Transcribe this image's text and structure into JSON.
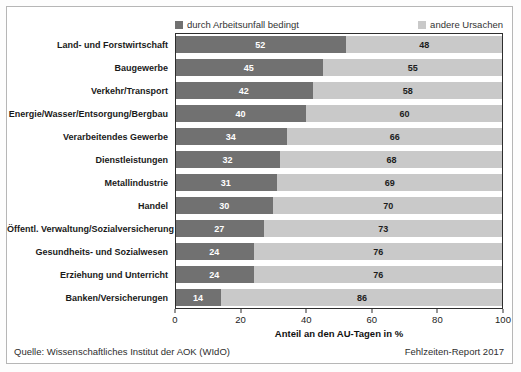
{
  "colors": {
    "accident": "#717171",
    "other": "#c9c9c9",
    "plot_border": "#2e2e2e",
    "frame_border": "#b6b6b6"
  },
  "legend": {
    "items": [
      {
        "label": "durch Arbeitsunfall bedingt",
        "color": "#717171"
      },
      {
        "label": "andere Ursachen",
        "color": "#c9c9c9"
      }
    ]
  },
  "chart_data": {
    "type": "bar",
    "orientation": "horizontal",
    "stacked": true,
    "categories": [
      "Land- und Forstwirtschaft",
      "Baugewerbe",
      "Verkehr/Transport",
      "Energie/Wasser/Entsorgung/Bergbau",
      "Verarbeitendes Gewerbe",
      "Dienstleistungen",
      "Metallindustrie",
      "Handel",
      "Öffentl. Verwaltung/Sozialversicherung",
      "Gesundheits- und Sozialwesen",
      "Erziehung und Unterricht",
      "Banken/Versicherungen"
    ],
    "series": [
      {
        "name": "durch Arbeitsunfall bedingt",
        "values": [
          52,
          45,
          42,
          40,
          34,
          32,
          31,
          30,
          27,
          24,
          24,
          14
        ]
      },
      {
        "name": "andere Ursachen",
        "values": [
          48,
          55,
          58,
          60,
          66,
          68,
          69,
          70,
          73,
          76,
          76,
          86
        ]
      }
    ],
    "xlabel": "Anteil an den AU-Tagen in %",
    "xticks": [
      0,
      20,
      40,
      60,
      80,
      100
    ],
    "xlim": [
      0,
      100
    ],
    "legend_position": "top",
    "value_labels": true,
    "grid": false
  },
  "footer": {
    "source": "Quelle: Wissenschaftliches Institut der AOK (WIdO)",
    "report": "Fehlzeiten-Report 2017"
  }
}
